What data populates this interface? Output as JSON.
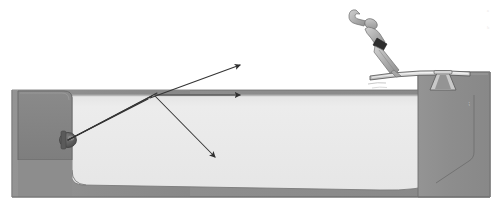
{
  "diagram": {
    "background_color": "#ffffff"
  },
  "colors": {
    "concrete": "#8e8e8e",
    "concrete_dark": "#7c7c7c",
    "concrete_edge": "#6e6e6e",
    "water": "#e9e9e9",
    "water_deep": "#e2e2e2",
    "water_surface_line": "#b9b9b9",
    "air": "#ffffff",
    "ray": "#3a3a3a",
    "lamp": "#6a6a6a",
    "lamp_dark": "#4f4f4f",
    "skin": "#b5b5b5",
    "suit": "#2e2e2e",
    "board": "#d8d8d8",
    "board_edge": "#5a5a5a",
    "outline": "#5a5a5a",
    "faint_text": "#e8e4e4"
  },
  "structure": {
    "pool_label": "swimming pool",
    "left_wall_label": "left pool wall",
    "right_wall_label": "right pool wall",
    "floor_label": "pool floor",
    "water_label": "water body",
    "water_surface_label": "water surface",
    "deck_label": "pool deck"
  },
  "light_source": {
    "name": "underwater pool light",
    "x": 68,
    "y": 140,
    "radius": 7
  },
  "surface_point": {
    "name": "incidence point at water surface",
    "x": 153,
    "y": 95
  },
  "rays": [
    {
      "id": "incident-ray-1",
      "label": "incident ray (lower)",
      "from": [
        68,
        140
      ],
      "to": [
        148,
        99
      ],
      "arrow": false
    },
    {
      "id": "incident-ray-2",
      "label": "incident ray (middle)",
      "from": [
        68,
        140
      ],
      "to": [
        152,
        96
      ],
      "arrow": false
    },
    {
      "id": "incident-ray-3",
      "label": "incident ray (upper)",
      "from": [
        68,
        140
      ],
      "to": [
        157,
        93
      ],
      "arrow": false
    },
    {
      "id": "refracted-ray",
      "label": "refracted ray into air",
      "from": [
        150,
        98
      ],
      "to": [
        240,
        65
      ],
      "arrow": true
    },
    {
      "id": "grazing-ray",
      "label": "ray along the water surface",
      "from": [
        155,
        95
      ],
      "to": [
        240,
        95
      ],
      "arrow": true
    },
    {
      "id": "reflected-ray",
      "label": "reflected ray back into water",
      "from": [
        155,
        96
      ],
      "to": [
        215,
        157
      ],
      "arrow": true
    }
  ],
  "diver": {
    "name": "diver",
    "pose": "head-down entry, arms extended",
    "x": 380,
    "y": 32
  },
  "diving_board": {
    "name": "springboard",
    "label": "diving board",
    "tip_x": 372,
    "base_x": 466,
    "y": 72,
    "fulcrum_x": 443
  },
  "annotations": {
    "mark_a": "ᵃ",
    "mark_b": "ᵇ"
  }
}
